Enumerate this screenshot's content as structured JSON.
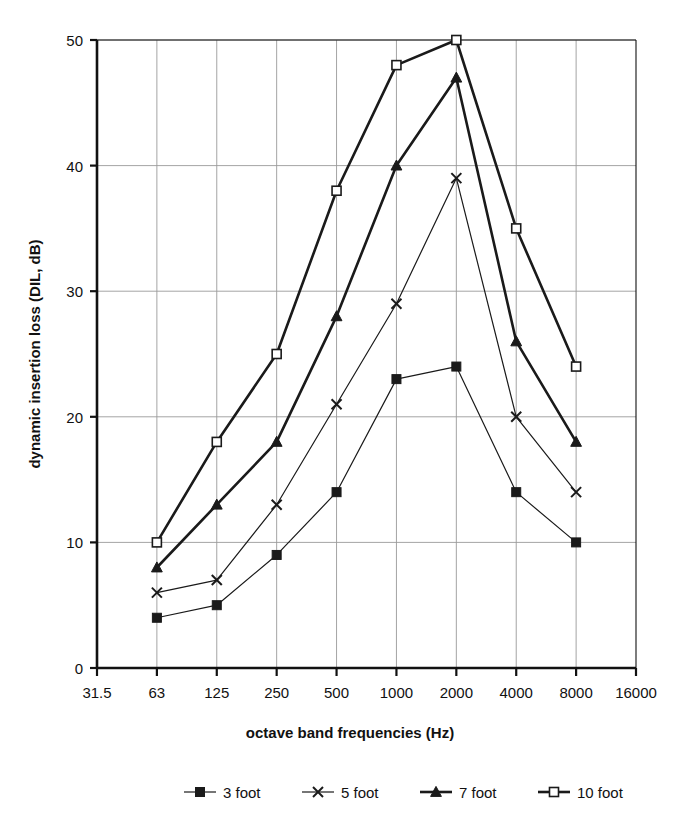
{
  "chart_data": {
    "type": "line",
    "title": "",
    "xlabel": "octave band frequencies (Hz)",
    "ylabel": "dynamic insertion loss (DIL, dB)",
    "x_tick_labels": [
      "31.5",
      "63",
      "125",
      "250",
      "500",
      "1000",
      "2000",
      "4000",
      "8000",
      "16000"
    ],
    "x_scale": "octave (log2)",
    "y_tick_labels": [
      "0",
      "10",
      "20",
      "30",
      "40",
      "50"
    ],
    "y_ticks": [
      0,
      10,
      20,
      30,
      40,
      50
    ],
    "ylim": [
      0,
      50
    ],
    "grid": true,
    "grid_color": "#999999",
    "legend_position": "bottom",
    "categories": [
      63,
      125,
      250,
      500,
      1000,
      2000,
      4000,
      8000
    ],
    "series": [
      {
        "name": "3 foot",
        "marker": "filled-square",
        "color": "#1a1a1a",
        "line_width": 1.2,
        "values": [
          4,
          5,
          9,
          14,
          23,
          24,
          14,
          10
        ]
      },
      {
        "name": "5 foot",
        "marker": "cross-x",
        "color": "#1a1a1a",
        "line_width": 1.2,
        "values": [
          6,
          7,
          13,
          21,
          29,
          39,
          20,
          14
        ]
      },
      {
        "name": "7 foot",
        "marker": "filled-triangle",
        "color": "#1a1a1a",
        "line_width": 2.6,
        "values": [
          8,
          13,
          18,
          28,
          40,
          47,
          26,
          18
        ]
      },
      {
        "name": "10 foot",
        "marker": "open-square",
        "color": "#1a1a1a",
        "line_width": 2.6,
        "values": [
          10,
          18,
          25,
          38,
          48,
          50,
          35,
          24
        ]
      }
    ]
  },
  "legend": {
    "entries": [
      {
        "label": "3 foot",
        "marker": "filled-square"
      },
      {
        "label": "5 foot",
        "marker": "cross-x"
      },
      {
        "label": "7 foot",
        "marker": "filled-triangle"
      },
      {
        "label": "10 foot",
        "marker": "open-square"
      }
    ]
  },
  "colors": {
    "ink": "#1a1a1a",
    "grid": "#9a9a9a",
    "axis": "#111111",
    "background": "#ffffff"
  }
}
